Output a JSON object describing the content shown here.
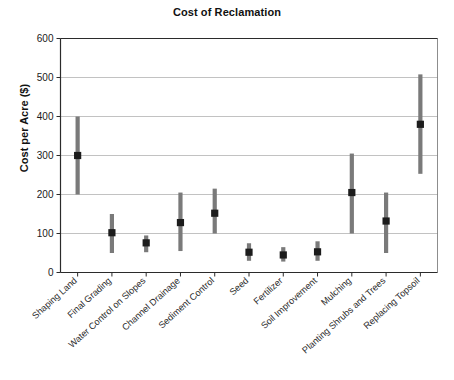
{
  "chart_data": {
    "type": "bar",
    "title": "Cost of Reclamation",
    "xlabel": "",
    "ylabel": "Cost per Acre ($)",
    "ylim": [
      0,
      600
    ],
    "yticks": [
      0,
      100,
      200,
      300,
      400,
      500,
      600
    ],
    "ytick_labels": [
      "0",
      "100",
      "200",
      "300",
      "400",
      "500",
      "600"
    ],
    "grid": true,
    "legend": null,
    "categories": [
      "Shaping Land",
      "Final Grading",
      "Water Control on Slopes",
      "Channel Drainage",
      "Sediment Control",
      "Seed",
      "Fertilizer",
      "Soil Improvement",
      "Mulching",
      "Planting Shrubs and Trees",
      "Replacing Topsoil"
    ],
    "series": [
      {
        "name": "Typical cost",
        "values": [
          300,
          102,
          76,
          128,
          152,
          52,
          45,
          53,
          205,
          132,
          380
        ]
      },
      {
        "name": "Low estimate",
        "values": [
          200,
          50,
          52,
          55,
          100,
          30,
          28,
          30,
          100,
          50,
          253
        ]
      },
      {
        "name": "High estimate",
        "values": [
          400,
          150,
          95,
          205,
          215,
          75,
          65,
          80,
          305,
          205,
          508
        ]
      }
    ],
    "colors": {
      "range_bar": "#7a7a7a",
      "marker": "#1c1c1c",
      "gridline": "#a8a8a8",
      "axis": "#2b2b2b",
      "background": "#ffffff"
    }
  }
}
